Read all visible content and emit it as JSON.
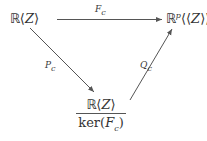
{
  "diagram": {
    "type": "commutative-triangle",
    "background_color": "#ffffff",
    "stroke_color": "#555555",
    "text_color": "#333333",
    "nodes": [
      {
        "id": "domain",
        "position": "top-left",
        "latex": "\\mathbb{R}\\langle Z \\rangle",
        "blackboard": "ℝ",
        "open_bracket": "⟨",
        "variable": "Z",
        "close_bracket": "⟩"
      },
      {
        "id": "codomain",
        "position": "top-right",
        "latex": "\\mathbb{R}^{p}\\langle\\langle Z \\rangle\\rangle",
        "blackboard": "ℝ",
        "superscript": "p",
        "open_bracket": "⟨⟨",
        "variable": "Z",
        "close_bracket": "⟩⟩"
      },
      {
        "id": "quotient",
        "position": "bottom-center",
        "latex": "\\frac{\\mathbb{R}\\langle Z\\rangle}{\\ker(F_c)}",
        "numerator": {
          "blackboard": "ℝ",
          "open_bracket": "⟨",
          "variable": "Z",
          "close_bracket": "⟩"
        },
        "denominator": {
          "operator": "ker",
          "open_paren": "(",
          "map": "F",
          "subscript": "c",
          "close_paren": ")"
        }
      }
    ],
    "edges": [
      {
        "id": "top",
        "from": "domain",
        "to": "codomain",
        "label": "F",
        "label_subscript": "c",
        "direction": "horizontal-right"
      },
      {
        "id": "left",
        "from": "domain",
        "to": "quotient",
        "label": "P",
        "label_subscript": "c",
        "direction": "down-right"
      },
      {
        "id": "right",
        "from": "quotient",
        "to": "codomain",
        "label": "Q",
        "label_subscript": "c",
        "direction": "up-right"
      }
    ]
  }
}
